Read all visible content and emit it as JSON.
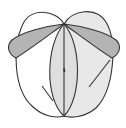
{
  "diagram": {
    "type": "geometric-figure",
    "colors": {
      "background": "#ffffff",
      "stroke": "#333333",
      "left_lobe_fill": "#ffffff",
      "right_lobe_fill": "#e8e8e8",
      "lens_fill": "#dedede",
      "petal_fill": "#b4b4b4"
    },
    "points": {
      "apex_top": [
        64,
        24
      ],
      "apex_bottom": [
        64,
        116
      ]
    },
    "labels": []
  }
}
